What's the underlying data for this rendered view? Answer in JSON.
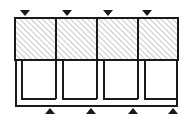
{
  "figure": {
    "type": "engineering-line-drawing",
    "background_color": "#ffffff",
    "line_color": "#1a1a1a",
    "hatch_color": "#9a9a9a",
    "marker_color": "#1a1a1a",
    "canvas": {
      "width": 193,
      "height": 121
    }
  },
  "outline": {
    "label": "outer-frame",
    "x": 15,
    "y": 18,
    "width": 163,
    "height": 89,
    "stroke_width": 2
  },
  "upper_storey": {
    "label": "hatched-storey",
    "y_top": 18,
    "y_bottom": 60,
    "fill": "hatch-45-up",
    "hatch_angle_deg": 45,
    "hatch_spacing": 3,
    "panel_count": 4,
    "panels": [
      {
        "name": "panel-1",
        "x": 15,
        "width": 41
      },
      {
        "name": "panel-2",
        "x": 56,
        "width": 41
      },
      {
        "name": "panel-3",
        "x": 97,
        "width": 41
      },
      {
        "name": "panel-4",
        "x": 138,
        "width": 40
      }
    ],
    "divider_x": [
      56,
      97,
      138
    ]
  },
  "lower_storey": {
    "label": "open-bay-storey",
    "y_top": 60,
    "y_bottom": 107,
    "bay_count": 4,
    "bays": [
      {
        "name": "bay-1",
        "x": 18,
        "width": 38
      },
      {
        "name": "bay-2",
        "x": 59,
        "width": 38
      },
      {
        "name": "bay-3",
        "x": 100,
        "width": 38
      },
      {
        "name": "bay-4",
        "x": 140,
        "width": 35
      }
    ],
    "bay_stroke_width": 2
  },
  "load_markers": {
    "label": "downward-load-arrows",
    "direction": "down",
    "count": 4,
    "y": 13,
    "size": 5,
    "x_positions": [
      25,
      67,
      108,
      147
    ]
  },
  "support_markers": {
    "label": "upward-support-reactions",
    "direction": "up",
    "count": 4,
    "y": 110,
    "size": 5,
    "x_positions": [
      50,
      91,
      133,
      173
    ]
  },
  "accessibility": {
    "description": "Line elevation of a four-bay two-storey frame. The upper storey is shown as a solid hatched band split into four panels; the lower storey shows four open bay frames with thick left and bottom members. Four downward triangular load markers sit above the structure and four upward triangular support markers sit below it."
  }
}
